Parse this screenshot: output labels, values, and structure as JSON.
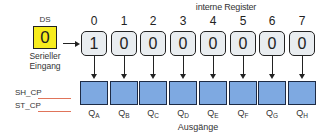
{
  "diagram": {
    "title": "interne Register",
    "input": {
      "label": "DS",
      "value": "0",
      "caption_line1": "Serieller",
      "caption_line2": "Eingang",
      "color": "#f7ec1e"
    },
    "registers": [
      {
        "index": "0",
        "value": "1"
      },
      {
        "index": "1",
        "value": "0"
      },
      {
        "index": "2",
        "value": "0"
      },
      {
        "index": "3",
        "value": "0"
      },
      {
        "index": "4",
        "value": "0"
      },
      {
        "index": "5",
        "value": "0"
      },
      {
        "index": "6",
        "value": "0"
      },
      {
        "index": "7",
        "value": "0"
      }
    ],
    "outputs": [
      {
        "q": "Q",
        "sub": "A"
      },
      {
        "q": "Q",
        "sub": "B"
      },
      {
        "q": "Q",
        "sub": "C"
      },
      {
        "q": "Q",
        "sub": "D"
      },
      {
        "q": "Q",
        "sub": "E"
      },
      {
        "q": "Q",
        "sub": "F"
      },
      {
        "q": "Q",
        "sub": "G"
      },
      {
        "q": "Q",
        "sub": "H"
      }
    ],
    "signals": {
      "shift_clock": "SH_CP",
      "storage_clock": "ST_CP",
      "line_color": "#e0745a"
    },
    "outputs_label": "Ausgänge",
    "colors": {
      "register_fill": "#e9edf0",
      "output_fill": "#7ea9e1",
      "output_border": "#1d2b45"
    }
  }
}
